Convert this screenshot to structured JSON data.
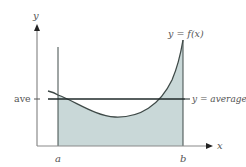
{
  "figure": {
    "type": "mean-value-integral-illustration",
    "axes": {
      "x_label": "x",
      "y_label": "y"
    },
    "ticks": {
      "a_label": "a",
      "b_label": "b",
      "ave_label": "ave"
    },
    "curve_label": "y = f(x)",
    "average_line_label": "y = average",
    "colors": {
      "fill": "#c9d8d8",
      "curve": "#3f4a48",
      "axis": "#7a7a7a",
      "average_line": "#1f2a2a",
      "text": "#555555"
    }
  }
}
